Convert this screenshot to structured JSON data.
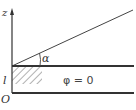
{
  "diagram": {
    "axis_label": "z",
    "height_label": "l",
    "origin_label": "O",
    "angle_label": "α",
    "region_label": "φ = 0",
    "colors": {
      "line": "#333333",
      "hatch": "#555555",
      "background": "#ffffff"
    }
  }
}
